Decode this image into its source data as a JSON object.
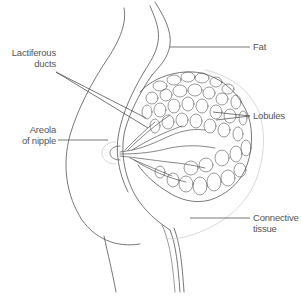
{
  "figure": {
    "line_color": "#555555",
    "light_line_color": "#c8c8c8",
    "background": "#ffffff"
  },
  "labels": {
    "lactiferous_ducts": {
      "line1": "Lactiferous",
      "line2": "ducts"
    },
    "areola": {
      "line1": "Areola",
      "line2": "of nipple"
    },
    "fat": {
      "line1": "Fat"
    },
    "lobules": {
      "line1": "Lobules"
    },
    "connective_tissue": {
      "line1": "Connective",
      "line2": "tissue"
    }
  }
}
